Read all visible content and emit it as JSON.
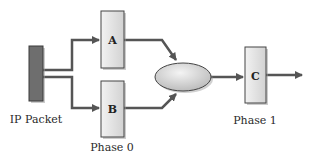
{
  "diagram": {
    "colors": {
      "packet": "#6e6e6e",
      "box_fill": "#e6e6e6",
      "box_stroke": "#444444",
      "arrow": "#555555",
      "ellipse_fill": "#d4d4d4"
    },
    "nodes": {
      "packet": {
        "label": "IP Packet"
      },
      "a": {
        "label": "A"
      },
      "b": {
        "label": "B"
      },
      "merge": {
        "label": ""
      },
      "c": {
        "label": "C"
      }
    },
    "phases": [
      {
        "label": "Phase 0"
      },
      {
        "label": "Phase 1"
      }
    ],
    "edges": [
      {
        "from": "packet",
        "to": "a"
      },
      {
        "from": "packet",
        "to": "b"
      },
      {
        "from": "a",
        "to": "merge"
      },
      {
        "from": "b",
        "to": "merge"
      },
      {
        "from": "merge",
        "to": "c"
      },
      {
        "from": "c",
        "to": "output"
      }
    ]
  }
}
